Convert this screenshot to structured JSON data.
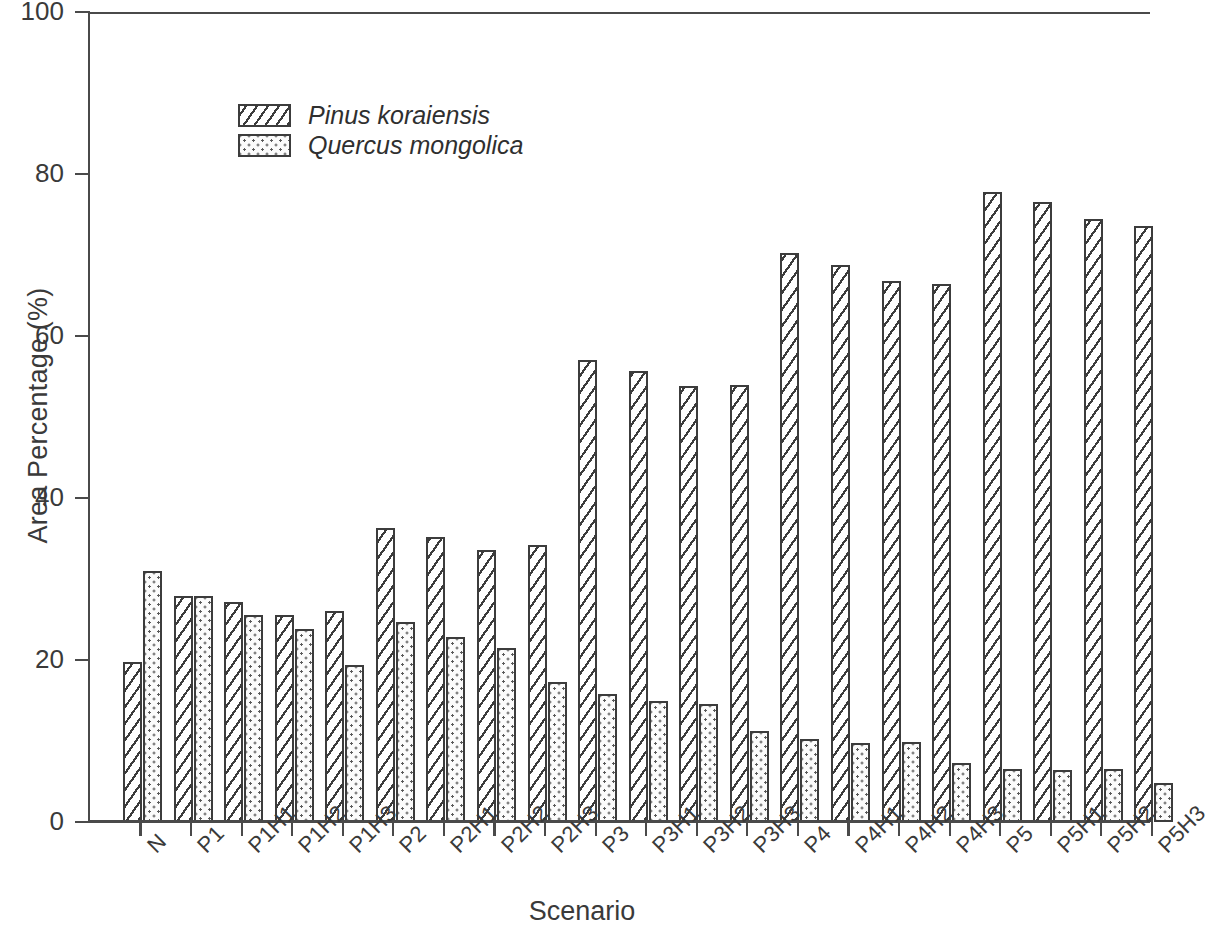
{
  "chart_data": {
    "type": "bar",
    "title": "",
    "subtitle": "",
    "xlabel": "Scenario",
    "ylabel": "Area Percentage (%)",
    "ylim": [
      0,
      100
    ],
    "yticks": [
      0,
      20,
      40,
      60,
      80,
      100
    ],
    "ytick_labels": [
      "0",
      "20",
      "40",
      "60",
      "80",
      "100"
    ],
    "grid": false,
    "legend_position": "upper-left-inside",
    "categories": [
      "N",
      "P1",
      "P1H1",
      "P1H2",
      "P1H3",
      "P2",
      "P2H1",
      "P2H2",
      "P2H3",
      "P3",
      "P3H1",
      "P3H2",
      "P3H3",
      "P4",
      "P4H1",
      "P4H2",
      "P4H3",
      "P5",
      "P5H1",
      "P5H2",
      "P5H3"
    ],
    "series": [
      {
        "name": "Pinus koraiensis",
        "pattern": "diagonal-hatch",
        "values": [
          19.7,
          27.9,
          27.2,
          25.5,
          26.1,
          36.3,
          35.2,
          33.6,
          34.2,
          57.1,
          55.7,
          53.8,
          54.0,
          70.3,
          68.8,
          66.8,
          66.4,
          77.8,
          76.5,
          74.4,
          73.6
        ]
      },
      {
        "name": "Quercus mongolica",
        "pattern": "dotted",
        "values": [
          31.0,
          27.9,
          25.5,
          23.8,
          19.4,
          24.7,
          22.9,
          21.5,
          17.3,
          15.8,
          14.9,
          14.6,
          11.2,
          10.3,
          9.8,
          9.9,
          7.3,
          6.6,
          6.4,
          6.5,
          4.8
        ]
      }
    ]
  },
  "legend": {
    "entries": [
      {
        "label": "Pinus koraiensis",
        "pattern": "diagonal-hatch"
      },
      {
        "label": "Quercus mongolica",
        "pattern": "dotted"
      }
    ]
  },
  "colors": {
    "axis": "#4a4a4a",
    "bar_outline": "#3c3c3c",
    "hatch": "#3c3c3c",
    "dot": "#5a5a5a",
    "background": "#ffffff",
    "text": "#3a3a3a"
  }
}
